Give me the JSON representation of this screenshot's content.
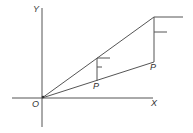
{
  "diagram": {
    "labels": {
      "y_axis": "Y",
      "x_axis": "X",
      "origin": "O",
      "point_mid": "P",
      "point_right": "P"
    }
  }
}
